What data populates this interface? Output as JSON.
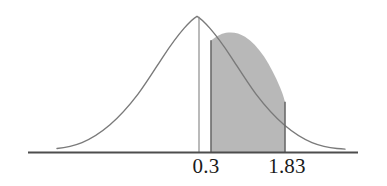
{
  "figure": {
    "background_color": "#ffffff"
  },
  "axis": {
    "name": "horizontal-axis",
    "color": "#4d4d4d",
    "x_start_px": 28,
    "x_end_px": 358,
    "y_px": 152
  },
  "labels": {
    "lower": "0.3",
    "upper": "1.83"
  },
  "markers": {
    "lower_line_color": "#808080",
    "shade_edge_color": "#6b6b6b"
  },
  "curve": {
    "stroke_color": "#7a7a7a",
    "stroke_width": 1.4,
    "fill_color": "#b8b8b8",
    "fill_opacity": 1,
    "peak_x_px": 197,
    "peak_y_px": 16,
    "baseline_y_px": 152,
    "left_tail_x_px": 57,
    "right_tail_x_px": 345
  },
  "chart_data": {
    "type": "area",
    "title": "",
    "subtitle": "",
    "xlabel": "",
    "ylabel": "",
    "distribution": "standard normal (bell curve)",
    "grid": false,
    "legend": null,
    "xlim": [
      -2.55,
      3.45
    ],
    "ylim": [
      0,
      1
    ],
    "tick_labels": [
      "0.3",
      "1.83"
    ],
    "tick_values": [
      0.3,
      1.83
    ],
    "tick_x_px": [
      199,
      285
    ],
    "vertical_lines": [
      {
        "label": "0.3",
        "value": 0.3,
        "x_px": 199,
        "style": "thin-solid"
      }
    ],
    "shaded_regions": [
      {
        "from_label": "0.3",
        "to_label": "1.83",
        "from_value": 0.3,
        "to_value": 1.83,
        "from_x_px": 211,
        "to_x_px": 285,
        "fill": "#b8b8b8"
      }
    ],
    "x": [
      -2.55,
      -2.3,
      -2.05,
      -1.8,
      -1.55,
      -1.3,
      -1.05,
      -0.8,
      -0.55,
      -0.3,
      -0.05,
      0.2,
      0.45,
      0.7,
      0.95,
      1.2,
      1.45,
      1.7,
      1.95,
      2.2,
      2.45,
      2.7,
      2.95,
      3.2,
      3.45
    ],
    "y": [
      0.038,
      0.071,
      0.122,
      0.198,
      0.301,
      0.431,
      0.577,
      0.726,
      0.86,
      0.956,
      0.999,
      0.98,
      0.904,
      0.783,
      0.637,
      0.487,
      0.35,
      0.236,
      0.149,
      0.089,
      0.05,
      0.026,
      0.013,
      0.006,
      0.003
    ]
  }
}
